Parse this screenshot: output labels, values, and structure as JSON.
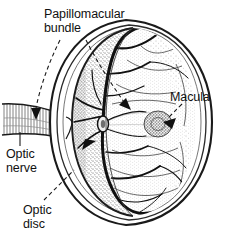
{
  "figure": {
    "background_color": "#ffffff",
    "ink_color": "#111111",
    "width": 229,
    "height": 245
  },
  "labels": {
    "papillomacular_bundle": "Papillomacular\nbundle",
    "optic_nerve": "Optic\nnerve",
    "optic_disc": "Optic\ndisc",
    "macula": "Macula"
  },
  "structures": [
    {
      "name": "eye-globe-outer-wall",
      "shading": "white",
      "outline": "double-line ellipse"
    },
    {
      "name": "retina-inner-surface",
      "shading": "stipple"
    },
    {
      "name": "retina-shaded-crescent",
      "shading": "dark-stipple"
    },
    {
      "name": "optic-nerve-tube",
      "shading": "hatched"
    },
    {
      "name": "optic-disc",
      "shading": "vessel-convergence"
    },
    {
      "name": "macula",
      "shading": "dark-stipple-oval"
    },
    {
      "name": "papillomacular-bundle-band",
      "shading": "fine-stipple-lens"
    },
    {
      "name": "retinal-blood-vessels",
      "shading": "solid-black-branching"
    }
  ],
  "leaders": [
    {
      "name": "papillomacular-to-nerve",
      "style": "dashed",
      "head": "solid-arrow"
    },
    {
      "name": "papillomacular-to-band",
      "style": "dashed",
      "head": "solid-arrow"
    },
    {
      "name": "optic-nerve-tick",
      "style": "solid",
      "head": "none"
    },
    {
      "name": "optic-disc-to-disc",
      "style": "dashed",
      "head": "solid-arrow"
    },
    {
      "name": "macula-to-macula",
      "style": "dashed",
      "head": "solid-arrow"
    }
  ]
}
